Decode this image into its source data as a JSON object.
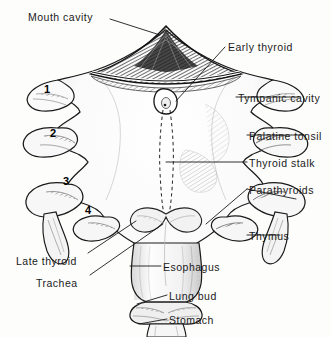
{
  "figure": {
    "background_color": "#fdfdfc",
    "ink_color": "#1a1a1a",
    "width": 331,
    "height": 337
  },
  "labels": [
    {
      "id": "mouth-cavity",
      "text": "Mouth cavity",
      "x": 28,
      "y": 12,
      "align": "left"
    },
    {
      "id": "early-thyroid",
      "text": "Early thyroid",
      "x": 228,
      "y": 42,
      "align": "left"
    },
    {
      "id": "tympanic-cavity",
      "text": "Tympanic cavity",
      "x": 238,
      "y": 93,
      "align": "left"
    },
    {
      "id": "palatine-tonsil",
      "text": "Palatine tonsil",
      "x": 249,
      "y": 131,
      "align": "left"
    },
    {
      "id": "thyroid-stalk",
      "text": "Thyroid stalk",
      "x": 249,
      "y": 158,
      "align": "left"
    },
    {
      "id": "parathyroids",
      "text": "Parathyroids",
      "x": 249,
      "y": 185,
      "align": "left"
    },
    {
      "id": "thymus",
      "text": "Thymus",
      "x": 249,
      "y": 231,
      "align": "left"
    },
    {
      "id": "late-thyroid",
      "text": "Late thyroid",
      "x": 16,
      "y": 256,
      "align": "left"
    },
    {
      "id": "trachea",
      "text": "Trachea",
      "x": 36,
      "y": 278,
      "align": "left"
    },
    {
      "id": "esophagus",
      "text": "Esophagus",
      "x": 163,
      "y": 262,
      "align": "left"
    },
    {
      "id": "lung-bud",
      "text": "Lung bud",
      "x": 169,
      "y": 291,
      "align": "left"
    },
    {
      "id": "stomach",
      "text": "Stomach",
      "x": 169,
      "y": 315,
      "align": "left"
    }
  ],
  "pouch_numbers": [
    {
      "id": "pouch-1",
      "text": "1",
      "x": 44,
      "y": 84
    },
    {
      "id": "pouch-2",
      "text": "2",
      "x": 50,
      "y": 128
    },
    {
      "id": "pouch-3",
      "text": "3",
      "x": 63,
      "y": 176
    },
    {
      "id": "pouch-4",
      "text": "4",
      "x": 85,
      "y": 205
    }
  ]
}
